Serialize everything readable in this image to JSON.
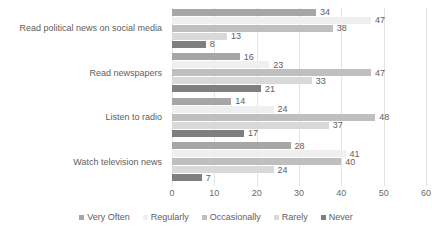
{
  "chart_data": {
    "type": "bar",
    "orientation": "horizontal",
    "title": "",
    "xlabel": "",
    "ylabel": "",
    "xlim": [
      0,
      60
    ],
    "xticks": [
      "0",
      "10",
      "20",
      "30",
      "40",
      "50",
      "60"
    ],
    "grid": true,
    "legend_position": "bottom",
    "categories": [
      "Read political news on social media",
      "Read newspapers",
      "Listen to radio",
      "Watch television news"
    ],
    "series": [
      {
        "name": "Very Often",
        "color": "#a6a6a6",
        "values": [
          34,
          16,
          14,
          28
        ]
      },
      {
        "name": "Regularly",
        "color": "#efefef",
        "values": [
          47,
          23,
          24,
          41
        ]
      },
      {
        "name": "Occasionally",
        "color": "#bfbfbf",
        "values": [
          38,
          47,
          48,
          40
        ]
      },
      {
        "name": "Rarely",
        "color": "#d9d9d9",
        "values": [
          13,
          33,
          37,
          24
        ]
      },
      {
        "name": "Never",
        "color": "#7f7f7f",
        "values": [
          8,
          21,
          17,
          7
        ]
      }
    ]
  },
  "axis": {
    "tick_labels": [
      "0",
      "10",
      "20",
      "30",
      "40",
      "50",
      "60"
    ]
  },
  "legend": {
    "items": [
      {
        "label": "Very Often"
      },
      {
        "label": "Regularly"
      },
      {
        "label": "Occasionally"
      },
      {
        "label": "Rarely"
      },
      {
        "label": "Never"
      }
    ]
  }
}
